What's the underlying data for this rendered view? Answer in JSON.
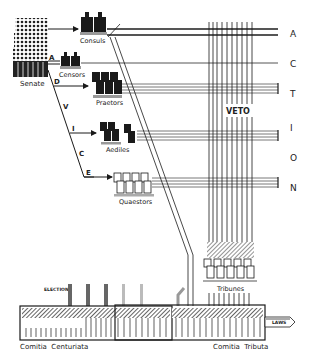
{
  "diagram": {
    "senate": {
      "label": "Senate"
    },
    "magistrates": [
      {
        "label": "Consuls"
      },
      {
        "label": "Censors"
      },
      {
        "label": "Praetors"
      },
      {
        "label": "Aediles"
      },
      {
        "label": "Quaestors"
      }
    ],
    "advice_letters": [
      "A",
      "D",
      "V",
      "I",
      "C",
      "E"
    ],
    "action_letters": [
      "A",
      "C",
      "T",
      "I",
      "O",
      "N"
    ],
    "veto_label": "VETO",
    "tribunes_label": "Tribunes",
    "election_label": "ELECTION",
    "assemblies": [
      {
        "label": "Comitia  Centuriata"
      },
      {
        "label": "Comitia  Tributa"
      }
    ],
    "laws_label": "LAWS",
    "colors": {
      "ink": "#1a1a1a",
      "gray": "#8a8a8a",
      "light": "#bbbbbb"
    }
  }
}
